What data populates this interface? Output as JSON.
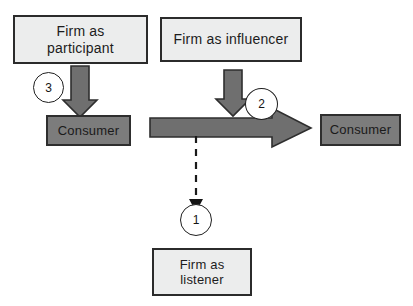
{
  "diagram": {
    "canvas": {
      "width": 413,
      "height": 306,
      "background": "#ffffff"
    },
    "colors": {
      "box_light_fill": "#eceded",
      "box_dark_fill": "#7c7c7c",
      "box_border": "#2b2b2b",
      "arrow_fill": "#6f6f6f",
      "arrow_stroke": "#2e2e2e",
      "badge_fill": "#ffffff",
      "badge_stroke": "#1f1f1f",
      "text": "#1c1c1c",
      "dashed_line": "#1a1a1a"
    },
    "nodes": [
      {
        "id": "firm-participant",
        "label": "Firm as\nparticipant",
        "style": "light"
      },
      {
        "id": "firm-influencer",
        "label": "Firm as influencer",
        "style": "light"
      },
      {
        "id": "consumer-left",
        "label": "Consumer",
        "style": "dark"
      },
      {
        "id": "consumer-right",
        "label": "Consumer",
        "style": "dark"
      },
      {
        "id": "firm-listener",
        "label": "Firm as\nlistener",
        "style": "light"
      }
    ],
    "badges": [
      {
        "id": "badge-1",
        "label": "1"
      },
      {
        "id": "badge-2",
        "label": "2"
      },
      {
        "id": "badge-3",
        "label": "3"
      }
    ],
    "connectors": [
      {
        "id": "arrow-participant-to-consumer",
        "kind": "block-arrow-down",
        "from": "firm-participant",
        "to": "consumer-left",
        "badge": "3"
      },
      {
        "id": "arrow-influencer-down",
        "kind": "block-arrow-down",
        "from": "firm-influencer",
        "to": "flow-arrow",
        "badge": "2"
      },
      {
        "id": "arrow-flow-to-consumer",
        "kind": "block-arrow-right",
        "from": "flow-arrow",
        "to": "consumer-right",
        "badge": "2"
      },
      {
        "id": "arrow-flow-to-listener",
        "kind": "dashed-arrow-down",
        "from": "flow-arrow",
        "to": "firm-listener",
        "badge": "1"
      }
    ]
  }
}
